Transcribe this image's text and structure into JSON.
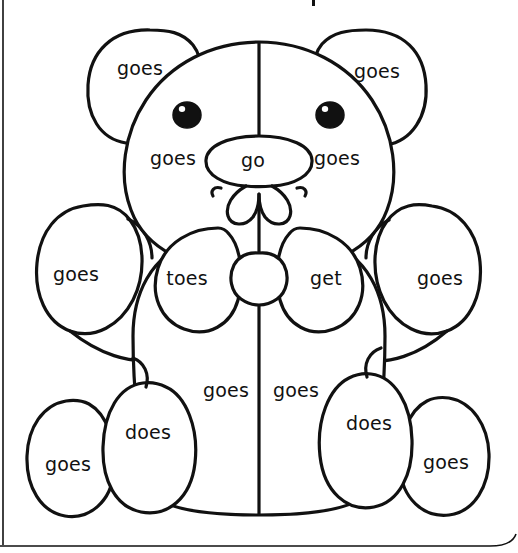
{
  "page": {
    "width": 518,
    "height": 553,
    "background_color": "#ffffff",
    "ink_color": "#111111",
    "line_width": 3,
    "top_partial_mark": "|",
    "borders": {
      "left_rule": true,
      "bottom_rule": true
    }
  },
  "subject": {
    "name": "teddy-bear-line-drawing",
    "description": "Black outline teddy bear divided into coloring regions, each labeled with a sight word"
  },
  "words": [
    {
      "id": "ear-left",
      "text": "goes",
      "x": 140,
      "y": 68,
      "size": 19,
      "region": "left-ear"
    },
    {
      "id": "ear-right",
      "text": "goes",
      "x": 377,
      "y": 71,
      "size": 19,
      "region": "right-ear"
    },
    {
      "id": "cheek-left",
      "text": "goes",
      "x": 173,
      "y": 158,
      "size": 19,
      "region": "left-cheek"
    },
    {
      "id": "muzzle",
      "text": "go",
      "x": 253,
      "y": 160,
      "size": 19,
      "region": "muzzle"
    },
    {
      "id": "cheek-right",
      "text": "goes",
      "x": 337,
      "y": 158,
      "size": 19,
      "region": "right-cheek"
    },
    {
      "id": "arm-left",
      "text": "goes",
      "x": 76,
      "y": 274,
      "size": 19,
      "region": "left-arm"
    },
    {
      "id": "bow-left",
      "text": "toes",
      "x": 187,
      "y": 278,
      "size": 19,
      "region": "left-bow-loop"
    },
    {
      "id": "bow-right",
      "text": "get",
      "x": 326,
      "y": 278,
      "size": 19,
      "region": "right-bow-loop"
    },
    {
      "id": "arm-right",
      "text": "goes",
      "x": 440,
      "y": 278,
      "size": 19,
      "region": "right-arm"
    },
    {
      "id": "belly-left",
      "text": "goes",
      "x": 226,
      "y": 390,
      "size": 19,
      "region": "left-belly"
    },
    {
      "id": "belly-right",
      "text": "goes",
      "x": 296,
      "y": 390,
      "size": 19,
      "region": "right-belly"
    },
    {
      "id": "leg-left",
      "text": "does",
      "x": 148,
      "y": 432,
      "size": 19,
      "region": "left-leg"
    },
    {
      "id": "leg-right",
      "text": "does",
      "x": 369,
      "y": 423,
      "size": 19,
      "region": "right-leg"
    },
    {
      "id": "foot-left",
      "text": "goes",
      "x": 68,
      "y": 464,
      "size": 19,
      "region": "left-foot"
    },
    {
      "id": "foot-right",
      "text": "goes",
      "x": 446,
      "y": 462,
      "size": 19,
      "region": "right-foot"
    }
  ],
  "word_list_unique": [
    "go",
    "goes",
    "get",
    "toes",
    "does"
  ],
  "word_counts": {
    "goes": 10,
    "does": 2,
    "go": 1,
    "get": 1,
    "toes": 1
  }
}
